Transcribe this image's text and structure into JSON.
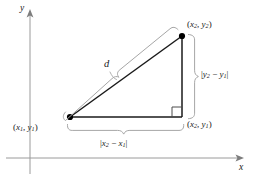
{
  "figure": {
    "type": "geometry-diagram",
    "topic": "distance-formula-right-triangle",
    "axes": {
      "x_label": "x",
      "y_label": "y",
      "origin_px": [
        30,
        158
      ],
      "x_axis_color": "#8c8c8c",
      "y_axis_color": "#8c8c8c"
    },
    "points": {
      "p1": {
        "label_open": "(",
        "x_var": "x",
        "x_sub": "1",
        "comma": ", ",
        "y_var": "y",
        "y_sub": "1",
        "label_close": ")",
        "px": [
          70,
          117
        ]
      },
      "p2": {
        "label_open": "(",
        "x_var": "x",
        "x_sub": "2",
        "comma": ", ",
        "y_var": "y",
        "y_sub": "2",
        "label_close": ")",
        "px": [
          182,
          36
        ]
      },
      "corner": {
        "label_open": "(",
        "x_var": "x",
        "x_sub": "2",
        "comma": ", ",
        "y_var": "y",
        "y_sub": "1",
        "label_close": ")",
        "px": [
          182,
          117
        ]
      }
    },
    "labels": {
      "hypotenuse": "d",
      "vertical_leg": {
        "bar_open": "|",
        "a_var": "y",
        "a_sub": "2",
        "minus": " − ",
        "b_var": "y",
        "b_sub": "1",
        "bar_close": "|"
      },
      "horizontal_leg": {
        "bar_open": "|",
        "a_var": "x",
        "a_sub": "2",
        "minus": " − ",
        "b_var": "x",
        "b_sub": "1",
        "bar_close": "|"
      }
    },
    "colors": {
      "triangle_stroke": "#1a1a1a",
      "brace_stroke": "#a6a6a6",
      "axis_stroke": "#9a9a9a",
      "vertex_fill": "#000000",
      "right_angle_stroke": "#4d4d4d",
      "background": "#ffffff"
    },
    "right_angle_marker": "right-angle-square"
  }
}
